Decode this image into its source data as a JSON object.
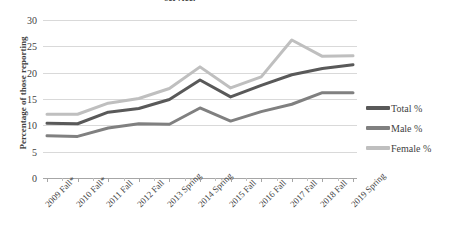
{
  "chart_data": {
    "type": "line",
    "title": "service.",
    "xlabel": "",
    "ylabel": "Percentage of those reporting",
    "ylim": [
      0,
      30
    ],
    "ytick_step": 5,
    "yticks": [
      0,
      5,
      10,
      15,
      20,
      25,
      30
    ],
    "grid": true,
    "legend_position": "right",
    "categories": [
      "2009 Fall*",
      "2010 Fall*",
      "2011 Fall",
      "2012 Fall",
      "2013 Spring",
      "2014 Spring",
      "2015 Fall",
      "2016 Fall",
      "2017 Fall",
      "2018 Fall",
      "2019 Spring"
    ],
    "series": [
      {
        "name": "Total %",
        "color": "#595959",
        "values": [
          10.4,
          10.3,
          12.5,
          13.2,
          14.9,
          18.6,
          15.4,
          17.6,
          19.6,
          20.8,
          21.5
        ]
      },
      {
        "name": "Male %",
        "color": "#808080",
        "values": [
          8.0,
          7.9,
          9.5,
          10.3,
          10.2,
          13.3,
          10.8,
          12.6,
          14.0,
          16.2,
          16.2
        ]
      },
      {
        "name": "Female %",
        "color": "#bfbfbf",
        "values": [
          12.1,
          12.1,
          14.2,
          15.1,
          17.0,
          21.1,
          17.1,
          19.2,
          26.2,
          23.1,
          23.2
        ]
      }
    ]
  },
  "legend": {
    "items": [
      {
        "label": "Total %",
        "color": "#595959"
      },
      {
        "label": "Male %",
        "color": "#808080"
      },
      {
        "label": "Female %",
        "color": "#bfbfbf"
      }
    ]
  }
}
